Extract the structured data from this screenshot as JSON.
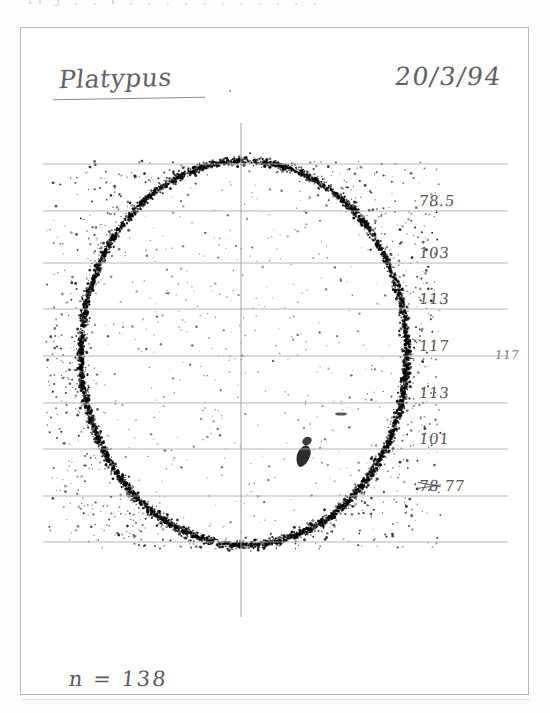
{
  "sheet": {
    "top_ghost_text": "fi  j    , ,  i  ;  ,  ,    ;  ;  ,  ,  ,  ,  , ,",
    "title": "Platypus",
    "title_trailing_mark": ".",
    "date": "20/3/94",
    "sample_size_label": "n = 138",
    "outer_right_value": "117"
  },
  "chart_data": {
    "type": "scatter",
    "title": "Platypus",
    "subtitle": "20/3/94",
    "xlabel": "",
    "ylabel": "",
    "grid": true,
    "legend": null,
    "annotations": [
      {
        "text": "n = 138",
        "position": "bottom-left"
      },
      {
        "text": "117",
        "position": "right-outside-frame"
      }
    ],
    "n": 138,
    "gridlines": [
      {
        "index": 0,
        "y_px": 163,
        "label": "",
        "count": null,
        "struck": false,
        "full_width": true
      },
      {
        "index": 1,
        "y_px": 210,
        "label": "78.5",
        "count": 78.5,
        "struck": false,
        "full_width": false
      },
      {
        "index": 2,
        "y_px": 262,
        "label": "103",
        "count": 103,
        "struck": false,
        "full_width": false
      },
      {
        "index": 3,
        "y_px": 308,
        "label": "113",
        "count": 113,
        "struck": false,
        "full_width": false
      },
      {
        "index": 4,
        "y_px": 355,
        "label": "117",
        "count": 117,
        "struck": false,
        "full_width": false
      },
      {
        "index": 5,
        "y_px": 402,
        "label": "113",
        "count": 113,
        "struck": false,
        "full_width": false
      },
      {
        "index": 6,
        "y_px": 448,
        "label": "101",
        "count": 101,
        "struck": false,
        "full_width": false
      },
      {
        "index": 7,
        "y_px": 495,
        "label": "77",
        "count": 77,
        "struck": true,
        "struck_text": "78",
        "full_width": false
      },
      {
        "index": 8,
        "y_px": 541,
        "label": "",
        "count": null,
        "struck": false,
        "full_width": true
      }
    ],
    "labels_ordered": [
      "78.5",
      "103",
      "113",
      "117",
      "113",
      "101",
      "77"
    ],
    "values_ordered": [
      78.5,
      103,
      113,
      117,
      113,
      101,
      77
    ],
    "axis_vertical": {
      "x_px": 240,
      "y_top_px": 122,
      "y_bottom_px": 616
    },
    "point_cloud": {
      "center_x_px": 243,
      "center_y_px": 352,
      "ring_radius_x_px": 163,
      "ring_radius_y_px": 192,
      "field_left_px": 45,
      "field_right_px": 440,
      "field_top_px": 160,
      "field_bottom_px": 548,
      "ink_color": "#2b2b2e"
    },
    "colors": {
      "ink": "#5c5c62",
      "grid": "#a9a9ae",
      "frame": "#b9b9bc",
      "paper": "#fdfdfd",
      "dots": "#242427"
    }
  }
}
